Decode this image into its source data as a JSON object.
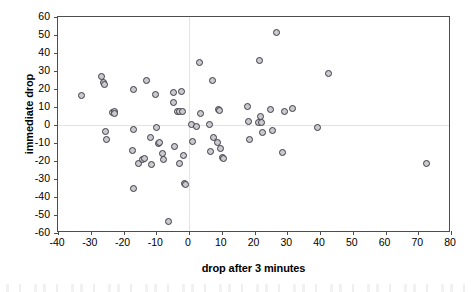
{
  "chart_data": {
    "type": "scatter",
    "title": "",
    "xlabel": "drop after 3 minutes",
    "ylabel": "immediate drop",
    "xlim": [
      -40,
      80
    ],
    "ylim": [
      -60,
      60
    ],
    "xticks": [
      -40,
      -30,
      -20,
      -10,
      0,
      10,
      20,
      30,
      40,
      50,
      60,
      70,
      80
    ],
    "yticks": [
      60,
      50,
      40,
      30,
      20,
      10,
      0,
      -10,
      -20,
      -30,
      -40,
      -50,
      -60
    ],
    "xtick_labels": [
      "-40",
      "-30",
      "-20",
      "-10",
      "0",
      "10",
      "20",
      "30",
      "40",
      "50",
      "60",
      "70",
      "80"
    ],
    "ytick_labels": [
      "60",
      "50",
      "40",
      "30",
      "20",
      "10",
      "0",
      "-10",
      "-20",
      "-30",
      "-40",
      "-50",
      "-60"
    ],
    "grid": false,
    "legend": null,
    "marker": {
      "shape": "circle",
      "size": 5,
      "edge_color": "#3a3a42",
      "fill_color": "#c9c9cf"
    },
    "axis_color": "#4d4d4d",
    "zero_line_color": "#e3e3e3",
    "points": [
      [
        -33.0,
        16.5
      ],
      [
        -26.8,
        27.0
      ],
      [
        -26.3,
        24.0
      ],
      [
        -26.0,
        23.0
      ],
      [
        -25.6,
        -3.5
      ],
      [
        -25.3,
        -7.5
      ],
      [
        -23.4,
        7.0
      ],
      [
        -23.0,
        8.0
      ],
      [
        -22.8,
        6.5
      ],
      [
        -17.2,
        20.0
      ],
      [
        -17.0,
        -2.0
      ],
      [
        -17.3,
        -14.0
      ],
      [
        -17.0,
        -35.0
      ],
      [
        -15.5,
        -21.0
      ],
      [
        -14.3,
        -19.0
      ],
      [
        -13.8,
        -18.5
      ],
      [
        -13.0,
        25.0
      ],
      [
        -12.0,
        -6.5
      ],
      [
        -11.6,
        -21.5
      ],
      [
        -10.3,
        17.0
      ],
      [
        -10.0,
        -1.0
      ],
      [
        -9.5,
        -10.0
      ],
      [
        -9.3,
        -9.5
      ],
      [
        -8.2,
        -15.5
      ],
      [
        -7.8,
        -19.0
      ],
      [
        -6.5,
        -53.5
      ],
      [
        -5.0,
        18.5
      ],
      [
        -4.8,
        13.0
      ],
      [
        -4.5,
        -11.5
      ],
      [
        -3.8,
        8.0
      ],
      [
        -3.2,
        7.8
      ],
      [
        -3.0,
        -21.0
      ],
      [
        -2.3,
        18.8
      ],
      [
        -2.0,
        8.0
      ],
      [
        -1.8,
        -16.5
      ],
      [
        -1.6,
        -32.0
      ],
      [
        -1.3,
        -32.5
      ],
      [
        0.6,
        0.8
      ],
      [
        1.0,
        -9.0
      ],
      [
        2.2,
        -0.5
      ],
      [
        3.0,
        35.0
      ],
      [
        3.3,
        6.5
      ],
      [
        6.2,
        0.3
      ],
      [
        6.4,
        -14.5
      ],
      [
        7.0,
        25.0
      ],
      [
        7.3,
        -6.8
      ],
      [
        8.6,
        -9.5
      ],
      [
        9.0,
        9.0
      ],
      [
        9.2,
        8.5
      ],
      [
        9.6,
        -12.8
      ],
      [
        10.2,
        -17.5
      ],
      [
        10.5,
        -18.5
      ],
      [
        17.8,
        10.5
      ],
      [
        18.0,
        2.0
      ],
      [
        18.3,
        -7.8
      ],
      [
        21.2,
        1.5
      ],
      [
        21.5,
        36.0
      ],
      [
        21.8,
        5.0
      ],
      [
        22.0,
        1.5
      ],
      [
        22.2,
        -3.8
      ],
      [
        24.8,
        9.0
      ],
      [
        25.3,
        -3.0
      ],
      [
        26.5,
        51.5
      ],
      [
        28.5,
        -15.0
      ],
      [
        29.0,
        8.0
      ],
      [
        31.5,
        9.5
      ],
      [
        39.0,
        -1.0
      ],
      [
        42.5,
        29.0
      ],
      [
        72.5,
        -21.0
      ]
    ],
    "n_points": 69
  },
  "axes": {
    "x_title": "drop after 3 minutes",
    "y_title": "immediate drop"
  }
}
